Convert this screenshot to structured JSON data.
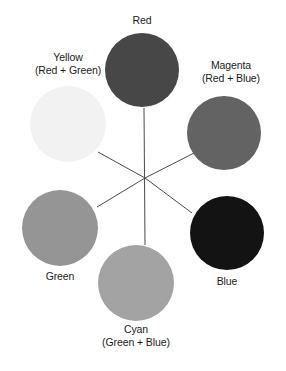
{
  "figure": {
    "background_color": "#ffffff",
    "width": 286,
    "height": 371,
    "center": {
      "x": 145,
      "y": 178
    },
    "line_color": "#4a4a4a"
  },
  "nodes": [
    {
      "id": "red",
      "name": "Red",
      "label": "Red",
      "sublabel": "",
      "color": "#474747",
      "circle": {
        "cx": 142,
        "cy": 70,
        "r": 37
      },
      "caption": {
        "x": 142,
        "y": 14
      },
      "spoke_to_center": true
    },
    {
      "id": "magenta",
      "name": "Magenta",
      "label": "Magenta",
      "sublabel": "(Red + Blue)",
      "color": "#636363",
      "circle": {
        "cx": 224,
        "cy": 133,
        "r": 37
      },
      "caption": {
        "x": 231,
        "y": 59
      },
      "spoke_to_center": true
    },
    {
      "id": "blue",
      "name": "Blue",
      "label": "Blue",
      "sublabel": "",
      "color": "#131313",
      "circle": {
        "cx": 227,
        "cy": 233,
        "r": 37
      },
      "caption": {
        "x": 227,
        "y": 275
      },
      "spoke_to_center": true
    },
    {
      "id": "cyan",
      "name": "Cyan",
      "label": "Cyan",
      "sublabel": "(Green + Blue)",
      "color": "#a3a3a3",
      "circle": {
        "cx": 136,
        "cy": 283,
        "r": 38
      },
      "caption": {
        "x": 136,
        "y": 323
      },
      "spoke_to_center": true
    },
    {
      "id": "green",
      "name": "Green",
      "label": "Green",
      "sublabel": "",
      "color": "#959595",
      "circle": {
        "cx": 60,
        "cy": 228,
        "r": 38
      },
      "caption": {
        "x": 60,
        "y": 270
      },
      "spoke_to_center": true
    },
    {
      "id": "yellow",
      "name": "Yellow",
      "label": "Yellow",
      "sublabel": "(Red + Green)",
      "color": "#f2f2f2",
      "circle": {
        "cx": 68,
        "cy": 124,
        "r": 38
      },
      "caption": {
        "x": 68,
        "y": 51
      },
      "spoke_to_center": true
    }
  ],
  "spokes": [
    {
      "name": "spoke-red",
      "x1": 144,
      "y1": 108,
      "x2": 145,
      "y2": 245
    },
    {
      "name": "spoke-magenta",
      "x1": 196,
      "y1": 152,
      "x2": 145,
      "y2": 178
    },
    {
      "name": "spoke-blue",
      "x1": 192,
      "y1": 213,
      "x2": 145,
      "y2": 178
    },
    {
      "name": "spoke-green",
      "x1": 97,
      "y1": 207,
      "x2": 145,
      "y2": 178
    },
    {
      "name": "spoke-yellow",
      "x1": 98,
      "y1": 152,
      "x2": 145,
      "y2": 178
    }
  ]
}
